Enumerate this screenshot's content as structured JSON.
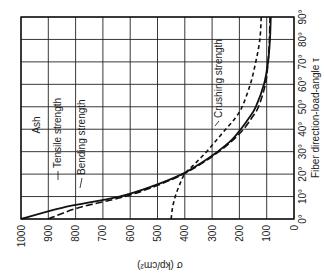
{
  "chart_data": {
    "type": "line",
    "title": "",
    "orientation_note": "Figure is rotated 90 degrees: sigma axis runs horizontally along the bottom (1000 at left to 0 at right), angle axis runs vertically on the right (0 deg at bottom to 90 deg at top).",
    "material_label": "Ash",
    "xlabel": "σ (kp/cm²)",
    "ylabel": "Fiber direction-load-angle τ",
    "sigma_ticks": [
      "1000",
      "900",
      "800",
      "700",
      "600",
      "500",
      "400",
      "300",
      "200",
      "100",
      "0"
    ],
    "angle_ticks": [
      "0°",
      "10°",
      "20°",
      "30°",
      "40°",
      "50°",
      "60°",
      "70°",
      "80°",
      "90°"
    ],
    "sigma_range": [
      0,
      1000
    ],
    "angle_range": [
      0,
      90
    ],
    "grid": true,
    "legend_position": "inline annotations",
    "x": [
      0,
      5,
      10,
      15,
      20,
      25,
      30,
      35,
      40,
      45,
      50,
      60,
      70,
      80,
      90
    ],
    "series": [
      {
        "name": "Tensile strength",
        "style": "solid",
        "values": [
          1000,
          850,
          640,
          510,
          410,
          340,
          280,
          230,
          195,
          165,
          140,
          110,
          95,
          88,
          85
        ]
      },
      {
        "name": "Bending strength",
        "style": "long-dash",
        "values": [
          900,
          790,
          620,
          500,
          405,
          335,
          275,
          225,
          185,
          155,
          130,
          105,
          95,
          90,
          88
        ]
      },
      {
        "name": "Crushing strength",
        "style": "short-dash",
        "values": [
          450,
          445,
          435,
          420,
          400,
          360,
          320,
          285,
          250,
          215,
          190,
          160,
          140,
          125,
          120
        ]
      }
    ]
  }
}
